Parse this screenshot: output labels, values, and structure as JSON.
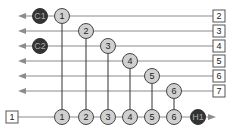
{
  "diagram": {
    "colors": {
      "line": "#8c8c8c",
      "vline": "#333333",
      "node_fill": "#d0d0d0",
      "node_stroke": "#444444",
      "dark_fill": "#333333",
      "dark_text": "#aaaaaa",
      "box_stroke": "#555555",
      "text": "#222222"
    },
    "input_box": {
      "label": "1",
      "x": 12,
      "y": 117
    },
    "output_boxes": [
      {
        "label": "2",
        "y": 16
      },
      {
        "label": "3",
        "y": 31
      },
      {
        "label": "4",
        "y": 46
      },
      {
        "label": "5",
        "y": 61
      },
      {
        "label": "6",
        "y": 76
      },
      {
        "label": "7",
        "y": 91
      }
    ],
    "row_nodes": [
      {
        "label": "1",
        "x": 62,
        "y": 16
      },
      {
        "label": "2",
        "x": 86,
        "y": 31
      },
      {
        "label": "3",
        "x": 108,
        "y": 46
      },
      {
        "label": "4",
        "x": 130,
        "y": 61
      },
      {
        "label": "5",
        "x": 152,
        "y": 76
      },
      {
        "label": "6",
        "x": 174,
        "y": 91
      }
    ],
    "bottom_nodes": [
      {
        "label": "1",
        "x": 62
      },
      {
        "label": "2",
        "x": 86
      },
      {
        "label": "3",
        "x": 108
      },
      {
        "label": "4",
        "x": 130
      },
      {
        "label": "5",
        "x": 152
      },
      {
        "label": "6",
        "x": 174
      }
    ],
    "dark_nodes": [
      {
        "label": "C1",
        "x": 40,
        "y": 16
      },
      {
        "label": "C2",
        "x": 40,
        "y": 46
      },
      {
        "label": "H1",
        "x": 198,
        "y": 117
      }
    ],
    "bottom_y": 117
  }
}
